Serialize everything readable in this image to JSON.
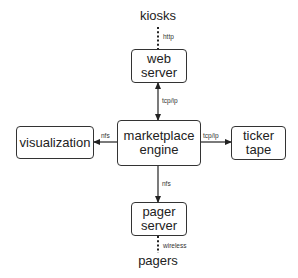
{
  "diagram": {
    "nodes": {
      "kiosks": {
        "label": "kiosks",
        "type": "external"
      },
      "web_server": {
        "line1": "web",
        "line2": "server",
        "type": "box"
      },
      "marketplace_engine": {
        "line1": "marketplace",
        "line2": "engine",
        "type": "box"
      },
      "visualization": {
        "line1": "visualization",
        "type": "box"
      },
      "ticker_tape": {
        "line1": "ticker",
        "line2": "tape",
        "type": "box"
      },
      "pager_server": {
        "line1": "pager",
        "line2": "server",
        "type": "box"
      },
      "pagers": {
        "label": "pagers",
        "type": "external"
      }
    },
    "edges": [
      {
        "from": "kiosks",
        "to": "web_server",
        "label": "http",
        "style": "dotted",
        "arrow": "none"
      },
      {
        "from": "web_server",
        "to": "marketplace_engine",
        "label": "tcp/ip",
        "style": "solid",
        "arrow": "both"
      },
      {
        "from": "marketplace_engine",
        "to": "visualization",
        "label": "nfs",
        "style": "solid",
        "arrow": "end"
      },
      {
        "from": "marketplace_engine",
        "to": "ticker_tape",
        "label": "tcp/ip",
        "style": "solid",
        "arrow": "end"
      },
      {
        "from": "marketplace_engine",
        "to": "pager_server",
        "label": "nfs",
        "style": "solid",
        "arrow": "end"
      },
      {
        "from": "pager_server",
        "to": "pagers",
        "label": "wireless",
        "style": "dotted",
        "arrow": "none"
      }
    ],
    "edge_labels": {
      "http": "http",
      "tcpip_web": "tcp/ip",
      "nfs_vis": "nfs",
      "tcpip_ticker": "tcp/ip",
      "nfs_pager": "nfs",
      "wireless": "wireless"
    }
  }
}
